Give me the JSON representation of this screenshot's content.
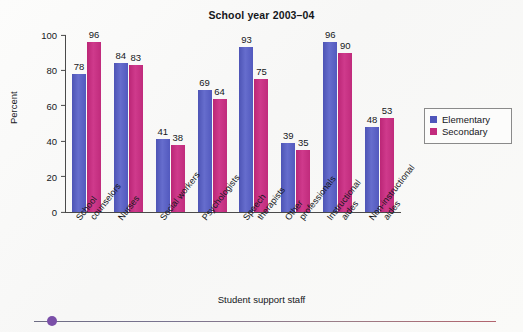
{
  "chart_data": {
    "type": "bar",
    "title": "School year 2003–04",
    "xlabel": "Student support staff",
    "ylabel": "Percent",
    "ylim": [
      0,
      100
    ],
    "yticks": [
      0,
      20,
      40,
      60,
      80,
      100
    ],
    "grid": false,
    "legend_position": "right",
    "categories": [
      "School counselors",
      "Nurses",
      "Social workers",
      "Psychologists",
      "Speech therapists",
      "Other professionals",
      "Instructional aides",
      "Non-instructional aides"
    ],
    "category_lines": [
      [
        "School",
        "counselors"
      ],
      [
        "Nurses"
      ],
      [
        "Social workers"
      ],
      [
        "Psychologists"
      ],
      [
        "Speech",
        "therapists"
      ],
      [
        "Other",
        "professionals"
      ],
      [
        "Instructional",
        "aides"
      ],
      [
        "Non-instructional",
        "aides"
      ]
    ],
    "series": [
      {
        "name": "Elementary",
        "color": "#4f56bb",
        "values": [
          78,
          84,
          41,
          69,
          93,
          39,
          96,
          48
        ]
      },
      {
        "name": "Secondary",
        "color": "#c22c7d",
        "values": [
          96,
          83,
          38,
          64,
          75,
          35,
          90,
          53
        ]
      }
    ]
  },
  "legend": {
    "items": [
      {
        "label": "Elementary"
      },
      {
        "label": "Secondary"
      }
    ]
  },
  "footer": {
    "dot_color": "#7a4fa8"
  }
}
